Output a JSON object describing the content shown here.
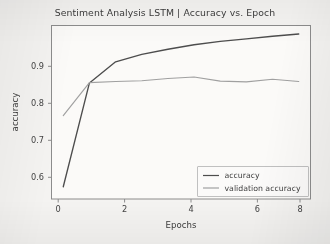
{
  "chart_data": {
    "type": "line",
    "title": "Sentiment Analysis LSTM | Accuracy vs. Epoch",
    "xlabel": "Epochs",
    "ylabel": "accuracy",
    "x": [
      0,
      1,
      2,
      3,
      4,
      5,
      6,
      7,
      8,
      9
    ],
    "xlim": [
      -0.45,
      9.45
    ],
    "ylim": [
      0.532,
      1.0
    ],
    "xticks": [
      0,
      2,
      4,
      6,
      8
    ],
    "xtick_labels": [
      "0",
      "2",
      "4",
      "6",
      "8"
    ],
    "yticks": [
      0.6,
      0.7,
      0.8,
      0.9
    ],
    "ytick_labels": [
      "0.6",
      "0.7",
      "0.8",
      "0.9"
    ],
    "grid": false,
    "legend_position": "lower right",
    "series": [
      {
        "name": "accuracy",
        "color": "#4d4d4d",
        "values": [
          0.565,
          0.845,
          0.902,
          0.922,
          0.936,
          0.948,
          0.957,
          0.964,
          0.971,
          0.977
        ]
      },
      {
        "name": "validation accuracy",
        "color": "#a0a0a0",
        "values": [
          0.757,
          0.846,
          0.849,
          0.851,
          0.857,
          0.861,
          0.85,
          0.848,
          0.855,
          0.849
        ]
      }
    ],
    "legend": [
      {
        "label": "accuracy",
        "color": "#4d4d4d"
      },
      {
        "label": "validation accuracy",
        "color": "#a0a0a0"
      }
    ]
  },
  "figure": {
    "background_color": "#f4f3f1",
    "axes_background_color": "#fbfaf8",
    "spine_color": "#8c8c8c"
  }
}
